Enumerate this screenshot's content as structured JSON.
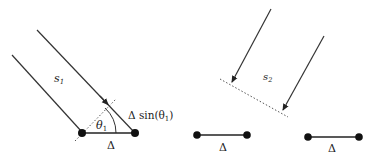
{
  "diagram": {
    "left_panel": {
      "signal_label": "s",
      "signal_sub": "1",
      "angle_label": "θ",
      "angle_sub": "1",
      "path_diff_label_prefix": "Δ sin(θ",
      "path_diff_sub": "1",
      "path_diff_suffix": ")",
      "baseline_label": "Δ"
    },
    "right_panel": {
      "signal_label": "s",
      "signal_sub": "2",
      "baseline_label_a": "Δ",
      "baseline_label_b": "Δ"
    },
    "colors": {
      "line": "#333333",
      "dot": "#111111",
      "dotted": "#555555"
    }
  }
}
